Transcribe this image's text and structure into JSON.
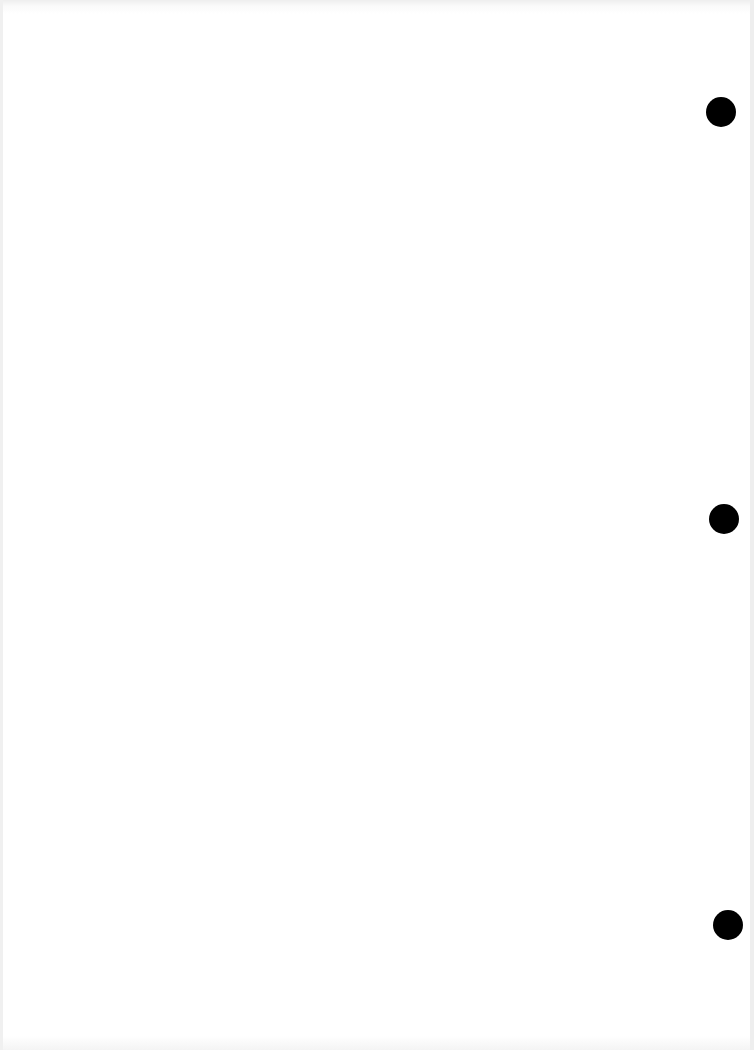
{
  "document": {
    "type": "blank scanned page",
    "text": "",
    "punch_holes": [
      {
        "cx": 721,
        "cy": 112,
        "d": 30
      },
      {
        "cx": 724,
        "cy": 519,
        "d": 30
      },
      {
        "cx": 728,
        "cy": 925,
        "d": 30
      }
    ],
    "colors": {
      "paper": "#ffffff",
      "hole": "#000000"
    }
  }
}
